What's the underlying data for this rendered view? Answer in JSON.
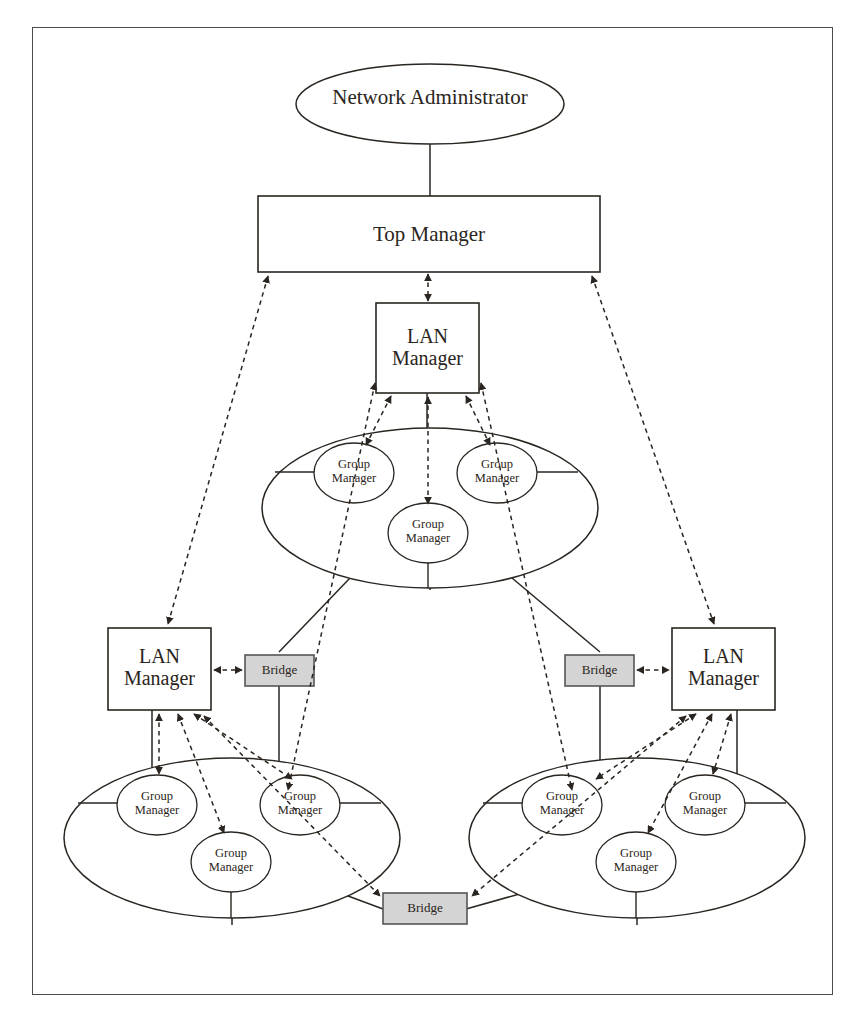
{
  "diagram": {
    "type": "network-management-hierarchy",
    "style": {
      "page_background": "#ffffff",
      "frame_border": "#4a4a4a",
      "stroke": "#2a2520",
      "bridge_fill": "#d4d4d4",
      "bridge_border": "#555555",
      "node_fill": "#ffffff"
    },
    "legend": {
      "solid_line_meaning": "physical network connection",
      "dashed_arrow_meaning": "management relationship (bidirectional)"
    }
  },
  "nodes": {
    "network_administrator": {
      "label": "Network Administrator",
      "shape": "ellipse",
      "level": 0
    },
    "top_manager": {
      "label": "Top Manager",
      "shape": "rectangle",
      "level": 1
    },
    "lan_manager_center": {
      "label_line1": "LAN",
      "label_line2": "Manager",
      "shape": "rectangle",
      "level": 2
    },
    "lan_manager_left": {
      "label_line1": "LAN",
      "label_line2": "Manager",
      "shape": "rectangle",
      "level": 2
    },
    "lan_manager_right": {
      "label_line1": "LAN",
      "label_line2": "Manager",
      "shape": "rectangle",
      "level": 2
    },
    "group_manager": {
      "label_line1": "Group",
      "label_line2": "Manager",
      "shape": "ellipse",
      "level": 3
    },
    "bridge": {
      "label": "Bridge",
      "shape": "rectangle",
      "filled": true
    }
  },
  "lans": [
    {
      "id": "lan-top",
      "group_managers": [
        {
          "label_line1": "Group",
          "label_line2": "Manager",
          "position": "left"
        },
        {
          "label_line1": "Group",
          "label_line2": "Manager",
          "position": "right"
        },
        {
          "label_line1": "Group",
          "label_line2": "Manager",
          "position": "bottom-center"
        }
      ]
    },
    {
      "id": "lan-bottom-left",
      "group_managers": [
        {
          "label_line1": "Group",
          "label_line2": "Manager",
          "position": "left"
        },
        {
          "label_line1": "Group",
          "label_line2": "Manager",
          "position": "right"
        },
        {
          "label_line1": "Group",
          "label_line2": "Manager",
          "position": "bottom-center"
        }
      ]
    },
    {
      "id": "lan-bottom-right",
      "group_managers": [
        {
          "label_line1": "Group",
          "label_line2": "Manager",
          "position": "left"
        },
        {
          "label_line1": "Group",
          "label_line2": "Manager",
          "position": "right"
        },
        {
          "label_line1": "Group",
          "label_line2": "Manager",
          "position": "bottom-center"
        }
      ]
    }
  ],
  "bridges": [
    {
      "id": "bridge-left",
      "label": "Bridge"
    },
    {
      "id": "bridge-right",
      "label": "Bridge"
    },
    {
      "id": "bridge-bottom",
      "label": "Bridge"
    }
  ],
  "labels": {
    "network_administrator": "Network Administrator",
    "top_manager": "Top Manager",
    "lan": "LAN",
    "manager": "Manager",
    "group": "Group",
    "bridge": "Bridge"
  }
}
